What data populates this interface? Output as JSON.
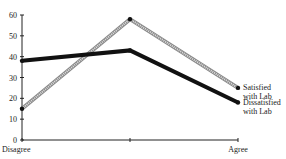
{
  "chart_data": {
    "type": "line",
    "title": "",
    "xlabel": "",
    "ylabel": "",
    "categories": [
      "Disagree",
      "",
      "Agree"
    ],
    "ylim": [
      0,
      60
    ],
    "yticks": [
      0,
      10,
      20,
      30,
      40,
      50,
      60
    ],
    "grid": false,
    "legend_position": "inline-right",
    "series": [
      {
        "name": "Satisfied with Lab",
        "label_lines": [
          "Satisfied",
          "with Lab"
        ],
        "values": [
          15,
          58,
          25
        ],
        "style": "gray-hatched",
        "color": "#9a9a9a"
      },
      {
        "name": "Dissatisfied with Lab",
        "label_lines": [
          "Dissatisfied",
          "with Lab"
        ],
        "values": [
          38,
          43,
          18
        ],
        "style": "thick-black",
        "color": "#111111"
      }
    ]
  }
}
